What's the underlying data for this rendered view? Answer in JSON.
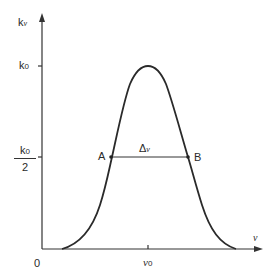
{
  "diagram": {
    "type": "line-profile",
    "y_axis": {
      "label": "k",
      "label_sub": "ν"
    },
    "x_axis": {
      "label": "ν",
      "origin": "0"
    },
    "y_ticks": {
      "peak": {
        "label": "k",
        "label_sub": "0"
      },
      "half": {
        "numerator": "k",
        "numerator_sub": "0",
        "denominator": "2"
      }
    },
    "x_ticks": {
      "center": {
        "label": "ν",
        "label_sub": "0"
      }
    },
    "points": {
      "a": "A",
      "b": "B"
    },
    "width_label": "Δ",
    "width_label_sym": "ν",
    "colors": {
      "line": "#2a2a2a",
      "background": "#ffffff"
    }
  }
}
